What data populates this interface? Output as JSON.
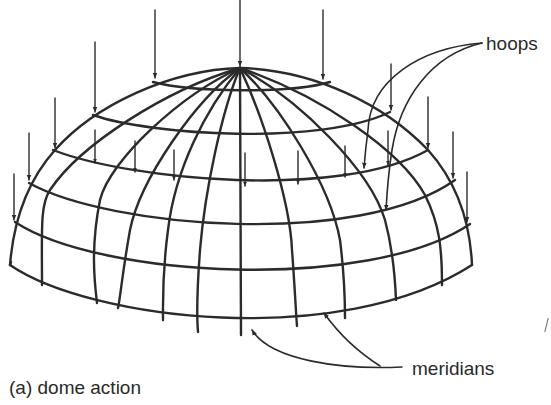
{
  "figure": {
    "caption": "(a) dome action",
    "labels": {
      "hoops": "hoops",
      "meridians": "meridians"
    },
    "colors": {
      "ink": "#2b2b2b",
      "background": "#ffffff"
    },
    "structure": {
      "type": "hemispherical dome grid",
      "hoop_count": 5,
      "meridian_count_visible": 11,
      "load_arrow_direction": "down"
    }
  }
}
